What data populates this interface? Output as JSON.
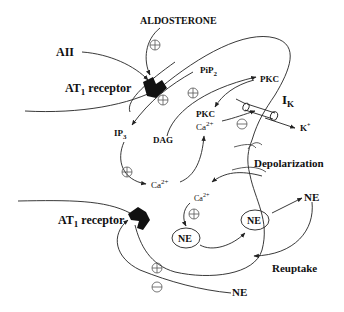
{
  "diagram": {
    "type": "signaling-pathway",
    "labels": {
      "aldosterone": "ALDOSTERONE",
      "aii": "AII",
      "at1_top_main": "AT",
      "at1_top_sub": "1",
      "at1_top_rest": " receptor",
      "pip2_main": "PiP",
      "pip2_sub": "2",
      "pkc_top": "PKC",
      "ik_main": "I",
      "ik_sub": "K",
      "k_plus": "K",
      "k_plus_sup": "+",
      "ip3_main": "IP",
      "ip3_sub": "3",
      "dag": "DAG",
      "pkc_mid": "PKC",
      "ca_mid_main": "Ca",
      "ca_mid_sup": "2+",
      "ca_low_main": "Ca",
      "ca_low_sup": "2+",
      "depolarization": "Depolarization",
      "ca_syn_main": "Ca",
      "ca_syn_sup": "2+",
      "ne_right": "NE",
      "ne_vesicle_1": "NE",
      "ne_vesicle_2": "NE",
      "at1_bot_main": "AT",
      "at1_bot_sub": "1",
      "at1_bot_rest": " receptor",
      "reuptake": "Reuptake",
      "ne_bottom": "NE"
    },
    "signs": {
      "plus": "+",
      "minus": "−"
    }
  }
}
